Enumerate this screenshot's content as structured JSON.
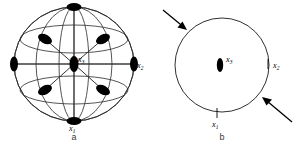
{
  "figure": {
    "panels": [
      {
        "id": "a",
        "caption": "a",
        "caption_x": 74,
        "caption_y": 140,
        "type": "sphere-wireframe-with-nodes",
        "center": {
          "x": 74,
          "y": 64
        },
        "radius": {
          "rx": 60,
          "ry": 57
        },
        "labels": [
          {
            "name": "x3",
            "base": "x",
            "sub": "3",
            "x": 78,
            "y": 62
          },
          {
            "name": "x2",
            "base": "x",
            "sub": "2",
            "x": 137,
            "y": 68
          },
          {
            "name": "x1",
            "base": "x",
            "sub": "1",
            "x": 69,
            "y": 131
          }
        ],
        "nodes": [
          {
            "name": "node-top",
            "cx": 74,
            "cy": 7,
            "rx": 7.5,
            "ry": 4.0,
            "rot": 0
          },
          {
            "name": "node-bottom",
            "cx": 74,
            "cy": 121,
            "rx": 7.5,
            "ry": 4.0,
            "rot": 0
          },
          {
            "name": "node-left",
            "cx": 14,
            "cy": 64,
            "rx": 4.0,
            "ry": 7.5,
            "rot": 0
          },
          {
            "name": "node-right",
            "cx": 134,
            "cy": 64,
            "rx": 4.0,
            "ry": 7.5,
            "rot": 0
          },
          {
            "name": "node-center",
            "cx": 74,
            "cy": 64,
            "rx": 4.5,
            "ry": 8.0,
            "rot": 0
          },
          {
            "name": "node-upper-left",
            "cx": 45,
            "cy": 39,
            "rx": 7.5,
            "ry": 4.5,
            "rot": 28
          },
          {
            "name": "node-upper-right",
            "cx": 103,
            "cy": 39,
            "rx": 7.5,
            "ry": 4.5,
            "rot": -28
          },
          {
            "name": "node-lower-left",
            "cx": 45,
            "cy": 90,
            "rx": 7.5,
            "ry": 4.5,
            "rot": -28
          },
          {
            "name": "node-lower-right",
            "cx": 103,
            "cy": 90,
            "rx": 7.5,
            "ry": 4.5,
            "rot": 28
          }
        ]
      },
      {
        "id": "b",
        "caption": "b",
        "caption_x": 222,
        "caption_y": 140,
        "type": "circle-with-inward-arrows",
        "center": {
          "x": 222,
          "y": 65
        },
        "radius": {
          "rx": 47,
          "ry": 47
        },
        "labels": [
          {
            "name": "x3",
            "base": "x",
            "sub": "3",
            "x": 226,
            "y": 62
          },
          {
            "name": "x2",
            "base": "x",
            "sub": "2",
            "x": 273,
            "y": 68
          },
          {
            "name": "x1",
            "base": "x",
            "sub": "1",
            "x": 217,
            "y": 127
          }
        ],
        "nodes": [
          {
            "name": "node-center",
            "cx": 220,
            "cy": 65,
            "rx": 3.2,
            "ry": 7.0,
            "rot": 0
          }
        ],
        "ticks": [
          {
            "name": "tick-x2",
            "x1": 268,
            "y1": 59,
            "x2": 268,
            "y2": 69
          },
          {
            "name": "tick-x1",
            "x1": 217,
            "y1": 108,
            "x2": 217,
            "y2": 118
          }
        ],
        "arrows": [
          {
            "name": "arrow-upper-left",
            "x1": 163,
            "y1": 10,
            "x2": 186,
            "y2": 29
          },
          {
            "name": "arrow-lower-right",
            "x1": 292,
            "y1": 122,
            "x2": 263,
            "y2": 98
          }
        ]
      }
    ]
  },
  "colors": {
    "stroke": "#1a1a1a",
    "node_fill": "#000000",
    "background": "#ffffff",
    "caption": "#3a3a3a"
  }
}
